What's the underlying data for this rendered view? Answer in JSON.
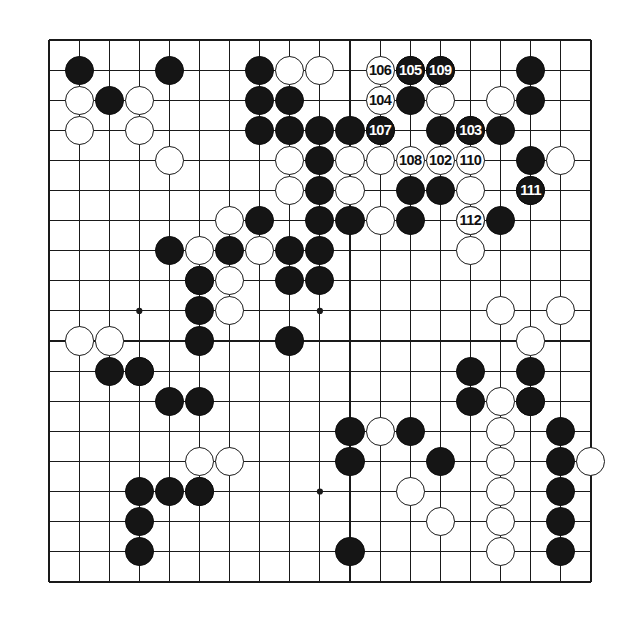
{
  "figure": {
    "type": "go-board-diagram",
    "board_size": 19,
    "title": "",
    "caption": "",
    "colors": {
      "background": "#ffffff",
      "grid_line": "#1a1a1a",
      "border_line": "#111111",
      "black_stone": "#151515",
      "white_stone": "#ffffff",
      "black_label_text": "#ffffff",
      "white_label_text": "#111111"
    },
    "geometry": {
      "origin_x": 49,
      "origin_y": 40,
      "cell": 30.1,
      "stone_radius": 14.6,
      "border_width": 2.6,
      "line_width": 1.1
    },
    "star_points": [
      [
        3,
        3
      ],
      [
        9,
        3
      ],
      [
        15,
        3
      ],
      [
        3,
        9
      ],
      [
        9,
        9
      ],
      [
        15,
        9
      ],
      [
        3,
        15
      ],
      [
        9,
        15
      ],
      [
        15,
        15
      ]
    ],
    "move_numbers": {
      "first": 102,
      "last": 112,
      "list": [
        102,
        103,
        104,
        105,
        106,
        107,
        108,
        109,
        110,
        111,
        112
      ]
    }
  },
  "chart_data": {
    "type": "diagram",
    "board_size": 19,
    "coordinate_system": "col,row zero-indexed from top-left",
    "numbered_stones": [
      {
        "label": "102",
        "color": "white",
        "col": 13,
        "row": 4
      },
      {
        "label": "103",
        "color": "black",
        "col": 14,
        "row": 3
      },
      {
        "label": "104",
        "color": "white",
        "col": 11,
        "row": 2
      },
      {
        "label": "105",
        "color": "black",
        "col": 12,
        "row": 1
      },
      {
        "label": "106",
        "color": "white",
        "col": 11,
        "row": 1
      },
      {
        "label": "107",
        "color": "black",
        "col": 11,
        "row": 3
      },
      {
        "label": "108",
        "color": "white",
        "col": 12,
        "row": 4
      },
      {
        "label": "109",
        "color": "black",
        "col": 13,
        "row": 1
      },
      {
        "label": "110",
        "color": "white",
        "col": 14,
        "row": 4
      },
      {
        "label": "111",
        "color": "black",
        "col": 16,
        "row": 5
      },
      {
        "label": "112",
        "color": "white",
        "col": 14,
        "row": 6
      }
    ],
    "black_stones": [
      [
        1,
        1
      ],
      [
        4,
        1
      ],
      [
        7,
        1
      ],
      [
        10,
        1
      ],
      [
        16,
        1
      ],
      [
        2,
        2
      ],
      [
        7,
        2
      ],
      [
        8,
        2
      ],
      [
        12,
        2
      ],
      [
        16,
        2
      ],
      [
        7,
        3
      ],
      [
        8,
        3
      ],
      [
        9,
        3
      ],
      [
        10,
        3
      ],
      [
        13,
        3
      ],
      [
        15,
        3
      ],
      [
        16,
        3
      ],
      [
        9,
        4
      ],
      [
        16,
        4
      ],
      [
        9,
        5
      ],
      [
        12,
        5
      ],
      [
        13,
        5
      ],
      [
        15,
        5
      ],
      [
        7,
        6
      ],
      [
        9,
        6
      ],
      [
        10,
        6
      ],
      [
        12,
        6
      ],
      [
        13,
        6
      ],
      [
        15,
        6
      ],
      [
        4,
        7
      ],
      [
        6,
        7
      ],
      [
        8,
        7
      ],
      [
        9,
        7
      ],
      [
        12,
        7
      ],
      [
        5,
        8
      ],
      [
        8,
        8
      ],
      [
        9,
        8
      ],
      [
        5,
        9
      ],
      [
        12,
        9
      ],
      [
        17,
        9
      ],
      [
        5,
        10
      ],
      [
        13,
        10
      ],
      [
        17,
        10
      ],
      [
        2,
        11
      ],
      [
        3,
        11
      ],
      [
        17,
        11
      ],
      [
        11,
        12
      ],
      [
        14,
        12
      ],
      [
        17,
        12
      ],
      [
        4,
        13
      ],
      [
        5,
        13
      ],
      [
        10,
        13
      ],
      [
        12,
        13
      ],
      [
        17,
        13
      ],
      [
        10,
        14
      ],
      [
        16,
        14
      ],
      [
        17,
        14
      ],
      [
        3,
        15
      ],
      [
        4,
        15
      ],
      [
        16,
        15
      ],
      [
        17,
        15
      ],
      [
        3,
        16
      ],
      [
        16,
        16
      ],
      [
        17,
        16
      ],
      [
        3,
        17
      ],
      [
        10,
        17
      ],
      [
        16,
        17
      ]
    ],
    "white_stones": [
      [
        8,
        1
      ],
      [
        9,
        1
      ],
      [
        13,
        2
      ],
      [
        15,
        2
      ],
      [
        1,
        2
      ],
      [
        3,
        2
      ],
      [
        1,
        3
      ],
      [
        3,
        3
      ],
      [
        10,
        4
      ],
      [
        11,
        4
      ],
      [
        17,
        4
      ],
      [
        4,
        4
      ],
      [
        8,
        4
      ],
      [
        8,
        5
      ],
      [
        10,
        5
      ],
      [
        14,
        5
      ],
      [
        6,
        6
      ],
      [
        11,
        6
      ],
      [
        14,
        6
      ],
      [
        5,
        7
      ],
      [
        7,
        7
      ],
      [
        5,
        8
      ],
      [
        6,
        8
      ],
      [
        10,
        8
      ],
      [
        6,
        9
      ],
      [
        9,
        9
      ],
      [
        14,
        9
      ],
      [
        16,
        9
      ],
      [
        14,
        10
      ],
      [
        17,
        10
      ],
      [
        1,
        11
      ],
      [
        2,
        11
      ],
      [
        3,
        12
      ],
      [
        15,
        12
      ],
      [
        16,
        12
      ],
      [
        11,
        13
      ],
      [
        15,
        13
      ],
      [
        5,
        14
      ],
      [
        6,
        14
      ],
      [
        15,
        14
      ],
      [
        18,
        14
      ],
      [
        12,
        15
      ],
      [
        15,
        15
      ],
      [
        5,
        15
      ],
      [
        15,
        16
      ],
      [
        15,
        17
      ]
    ]
  },
  "rendered_stones": {
    "black": [
      [
        1,
        1
      ],
      [
        4,
        1
      ],
      [
        7,
        1
      ],
      [
        12,
        1
      ],
      [
        13,
        1
      ],
      [
        16,
        1
      ],
      [
        2,
        2
      ],
      [
        7,
        2
      ],
      [
        8,
        2
      ],
      [
        12,
        2
      ],
      [
        16,
        2
      ],
      [
        7,
        3
      ],
      [
        8,
        3
      ],
      [
        9,
        3
      ],
      [
        10,
        3
      ],
      [
        11,
        3
      ],
      [
        13,
        3
      ],
      [
        14,
        3
      ],
      [
        15,
        3
      ],
      [
        9,
        4
      ],
      [
        16,
        4
      ],
      [
        9,
        5
      ],
      [
        12,
        5
      ],
      [
        13,
        5
      ],
      [
        16,
        5
      ],
      [
        7,
        6
      ],
      [
        9,
        6
      ],
      [
        10,
        6
      ],
      [
        12,
        6
      ],
      [
        15,
        6
      ],
      [
        4,
        7
      ],
      [
        6,
        7
      ],
      [
        8,
        7
      ],
      [
        9,
        7
      ],
      [
        5,
        8
      ],
      [
        8,
        8
      ],
      [
        9,
        8
      ],
      [
        5,
        9
      ],
      [
        5,
        10
      ],
      [
        8,
        10
      ],
      [
        2,
        11
      ],
      [
        3,
        11
      ],
      [
        14,
        11
      ],
      [
        4,
        12
      ],
      [
        5,
        12
      ],
      [
        14,
        12
      ],
      [
        10,
        13
      ],
      [
        12,
        13
      ],
      [
        17,
        13
      ],
      [
        10,
        14
      ],
      [
        13,
        14
      ],
      [
        17,
        14
      ],
      [
        3,
        15
      ],
      [
        4,
        15
      ],
      [
        5,
        15
      ],
      [
        17,
        15
      ],
      [
        3,
        16
      ],
      [
        17,
        16
      ],
      [
        3,
        17
      ],
      [
        10,
        17
      ],
      [
        17,
        17
      ],
      [
        16,
        11
      ],
      [
        16,
        12
      ]
    ],
    "white": [
      [
        8,
        1
      ],
      [
        9,
        1
      ],
      [
        1,
        2
      ],
      [
        3,
        2
      ],
      [
        13,
        2
      ],
      [
        15,
        2
      ],
      [
        1,
        3
      ],
      [
        3,
        3
      ],
      [
        4,
        4
      ],
      [
        8,
        4
      ],
      [
        10,
        4
      ],
      [
        11,
        4
      ],
      [
        17,
        4
      ],
      [
        8,
        5
      ],
      [
        10,
        5
      ],
      [
        14,
        5
      ],
      [
        6,
        6
      ],
      [
        11,
        6
      ],
      [
        14,
        6
      ],
      [
        5,
        7
      ],
      [
        7,
        7
      ],
      [
        14,
        7
      ],
      [
        5,
        8
      ],
      [
        6,
        8
      ],
      [
        6,
        9
      ],
      [
        15,
        9
      ],
      [
        17,
        9
      ],
      [
        1,
        10
      ],
      [
        2,
        10
      ],
      [
        3,
        11
      ],
      [
        16,
        10
      ],
      [
        15,
        12
      ],
      [
        16,
        12
      ],
      [
        11,
        13
      ],
      [
        15,
        13
      ],
      [
        5,
        14
      ],
      [
        6,
        14
      ],
      [
        15,
        14
      ],
      [
        18,
        14
      ],
      [
        12,
        15
      ],
      [
        15,
        15
      ],
      [
        5,
        15
      ],
      [
        15,
        16
      ],
      [
        15,
        17
      ],
      [
        13,
        16
      ]
    ]
  }
}
